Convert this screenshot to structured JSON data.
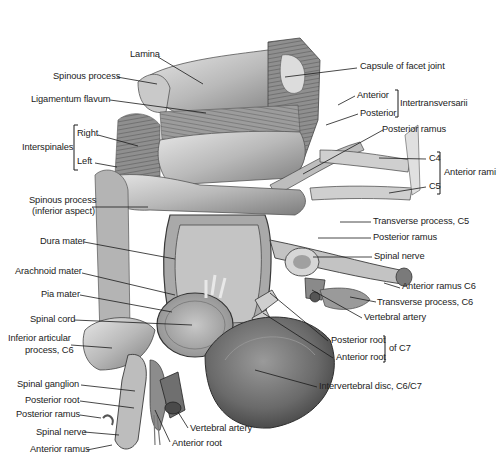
{
  "figure": {
    "labels_left": [
      {
        "id": "lamina",
        "text": "Lamina"
      },
      {
        "id": "spinous-process",
        "text": "Spinous process"
      },
      {
        "id": "ligamentum-flavum",
        "text": "Ligamentum flavum"
      },
      {
        "id": "interspinales-right",
        "text": "Right"
      },
      {
        "id": "interspinales-left",
        "text": "Left"
      },
      {
        "id": "interspinales",
        "text": "Interspinales"
      },
      {
        "id": "spinous-process-inferior-1",
        "text": "Spinous process"
      },
      {
        "id": "spinous-process-inferior-2",
        "text": "(inferior aspect)"
      },
      {
        "id": "dura-mater",
        "text": "Dura mater"
      },
      {
        "id": "arachnoid-mater",
        "text": "Arachnoid mater"
      },
      {
        "id": "pia-mater",
        "text": "Pia mater"
      },
      {
        "id": "spinal-cord",
        "text": "Spinal cord"
      },
      {
        "id": "inferior-articular-1",
        "text": "Inferior articular"
      },
      {
        "id": "inferior-articular-2",
        "text": "process, C6"
      },
      {
        "id": "spinal-ganglion",
        "text": "Spinal ganglion"
      },
      {
        "id": "posterior-root-left",
        "text": "Posterior root"
      },
      {
        "id": "posterior-ramus-left",
        "text": "Posterior ramus"
      },
      {
        "id": "spinal-nerve-left",
        "text": "Spinal nerve"
      },
      {
        "id": "anterior-ramus-left",
        "text": "Anterior ramus"
      }
    ],
    "labels_right": [
      {
        "id": "capsule-facet-joint",
        "text": "Capsule of facet joint"
      },
      {
        "id": "intertrans-anterior",
        "text": "Anterior"
      },
      {
        "id": "intertrans-posterior",
        "text": "Posterior"
      },
      {
        "id": "intertransversarii",
        "text": "Intertransversarii"
      },
      {
        "id": "posterior-ramus-top",
        "text": "Posterior ramus"
      },
      {
        "id": "c4",
        "text": "C4"
      },
      {
        "id": "c5",
        "text": "C5"
      },
      {
        "id": "anterior-rami",
        "text": "Anterior rami"
      },
      {
        "id": "transverse-process-c5",
        "text": "Transverse process, C5"
      },
      {
        "id": "posterior-ramus-mid",
        "text": "Posterior ramus"
      },
      {
        "id": "spinal-nerve-right",
        "text": "Spinal nerve"
      },
      {
        "id": "anterior-ramus-c6",
        "text": "Anterior ramus C6"
      },
      {
        "id": "transverse-process-c6",
        "text": "Transverse process, C6"
      },
      {
        "id": "vertebral-artery-right",
        "text": "Vertebral artery"
      },
      {
        "id": "posterior-root-c7",
        "text": "Posterior root"
      },
      {
        "id": "anterior-root-c7",
        "text": "Anterior root"
      },
      {
        "id": "of-c7",
        "text": "of C7"
      },
      {
        "id": "intervertebral-disc",
        "text": "Intervertebral disc, C6/C7"
      }
    ],
    "labels_bottom": [
      {
        "id": "vertebral-artery-bottom",
        "text": "Vertebral artery"
      },
      {
        "id": "anterior-root-bottom",
        "text": "Anterior root"
      }
    ],
    "colors": {
      "background": "#ffffff",
      "label_text": "#222222",
      "leader_line": "#1a1a1a",
      "bone_light": "#d9d9d9",
      "bone_mid": "#a8a8a8",
      "tissue_dark": "#6e6e6e",
      "shadow": "#3e3e3e"
    }
  }
}
